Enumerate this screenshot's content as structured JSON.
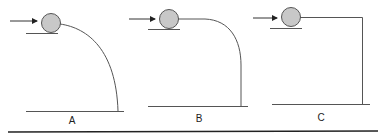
{
  "diagram": {
    "colors": {
      "line": "#555555",
      "ball_fill": "#c8c8c8",
      "ball_stroke": "#555555",
      "bottom_rule": "#222222"
    },
    "panels": [
      {
        "label": "A",
        "path_description": "gradual curved drop"
      },
      {
        "label": "B",
        "path_description": "horizontal then rounded drop"
      },
      {
        "label": "C",
        "path_description": "horizontal then sharp right-angle drop"
      }
    ]
  }
}
